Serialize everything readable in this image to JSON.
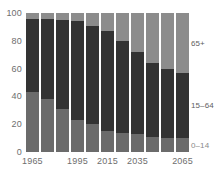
{
  "chart_data": {
    "type": "bar",
    "subtype": "stacked-percentage",
    "title": "",
    "subtitle": "",
    "xlabel": "",
    "ylabel": "",
    "ylim": [
      0,
      100
    ],
    "grid": false,
    "legend_position": "right",
    "categories": [
      "1965",
      "1975",
      "1985",
      "1995",
      "2005",
      "2015",
      "2025",
      "2035",
      "2045",
      "2055",
      "2065"
    ],
    "x_tick_labels": [
      "1965",
      "1995",
      "2015",
      "2035",
      "2065"
    ],
    "y_tick_labels": [
      "0",
      "20",
      "40",
      "60",
      "80",
      "100"
    ],
    "y_ticks": [
      0,
      20,
      40,
      60,
      80,
      100
    ],
    "series": [
      {
        "name": "0–14",
        "label": "0–14",
        "color": "#6b6b6b",
        "values": [
          43,
          38,
          31,
          23,
          20,
          15,
          14,
          13,
          11,
          10,
          10
        ]
      },
      {
        "name": "15–64",
        "label": "15–64",
        "color": "#333333",
        "values": [
          53,
          58,
          64,
          71,
          71,
          72,
          66,
          59,
          53,
          50,
          47
        ]
      },
      {
        "name": "65+",
        "label": "65+",
        "color": "#8c8c8c",
        "values": [
          4,
          4,
          5,
          6,
          9,
          13,
          20,
          28,
          36,
          40,
          43
        ]
      }
    ],
    "colors": {
      "young": "#6b6b6b",
      "working": "#333333",
      "old": "#8c8c8c",
      "axis_text": "#6e6e6e",
      "label_text": "#5e5e5e",
      "background": "#ffffff"
    }
  }
}
